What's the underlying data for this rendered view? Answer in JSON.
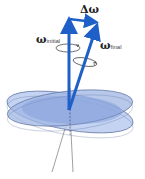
{
  "diagram": {
    "labels": {
      "delta_omega": "Δω",
      "omega_initial_symbol": "ω",
      "omega_initial_sub": "initial",
      "omega_final_symbol": "ω",
      "omega_final_sub": "final"
    },
    "colors": {
      "vector": "#1f5fc8",
      "disk_top": "#9fb6e3",
      "disk_bottom": "#b9cbee",
      "disk_overlap": "#7e9ad6",
      "disk_edge": "#5a6f9e",
      "axis_line": "#777777"
    }
  }
}
